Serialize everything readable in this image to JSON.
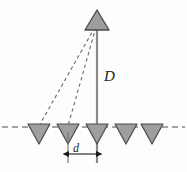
{
  "figure": {
    "kind": "antenna-array-geometry-diagram",
    "width": 187,
    "height": 172,
    "background_color": "#fdfdfc"
  },
  "labels": {
    "distance_vertical": "D",
    "spacing_horizontal": "d"
  },
  "colors": {
    "triangle_fill": "#9e9e9e",
    "triangle_stroke": "#4a4a4a",
    "solid_line": "#8a8a8a",
    "dashed_line": "#6b6b6b",
    "baseline": "#4a4a4a",
    "arrow": "#1c1c1c",
    "text": "#1c1c1c"
  },
  "geometry": {
    "baseline_y": 127,
    "apex": {
      "cx": 97,
      "cy": 21,
      "half_width": 12,
      "height": 19
    },
    "array_elements": [
      {
        "index": 0,
        "cx": 39,
        "cy": 127
      },
      {
        "index": 1,
        "cx": 68,
        "cy": 127
      },
      {
        "index": 2,
        "cx": 97,
        "cy": 127
      },
      {
        "index": 3,
        "cx": 126,
        "cy": 127
      },
      {
        "index": 4,
        "cx": 152,
        "cy": 127
      }
    ],
    "element_half_width": 11,
    "element_height": 18,
    "ray_targets": [
      0,
      1
    ],
    "spacing_arrow": {
      "x1": 68,
      "x2": 97,
      "y": 152
    },
    "tick_top": 130,
    "tick_bottom": 162
  }
}
